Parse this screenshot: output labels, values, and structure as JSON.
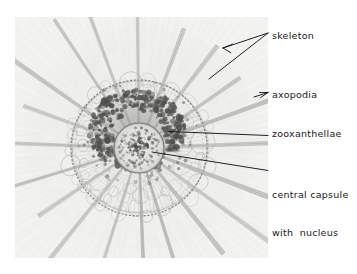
{
  "figure": {
    "type": "photomicrograph-diagram",
    "background_color": "#ffffff",
    "photo_background_color": "#f3f3f1",
    "ink_color": "#17171a"
  },
  "labels": [
    {
      "id": "skeleton",
      "text": "skeleton",
      "name": "label-skeleton",
      "leaders": 2
    },
    {
      "id": "axopodia",
      "text": "axopodia",
      "name": "label-axopodia",
      "leaders": 1
    },
    {
      "id": "zooxanthellae",
      "text": "zooxanthellae",
      "name": "label-zooxanthellae",
      "leaders": 1
    },
    {
      "id": "central_capsule",
      "text_line1": "central capsule",
      "text_line2": "with  nucleus",
      "name": "label-central-capsule",
      "leaders": 1
    }
  ]
}
